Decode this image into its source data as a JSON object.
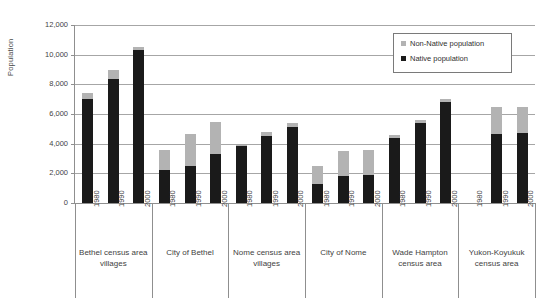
{
  "chart_data": {
    "type": "bar",
    "stacked": true,
    "title": "",
    "xlabel": "",
    "ylabel": "Population",
    "ylim": [
      0,
      12000
    ],
    "ytick_labels": [
      "12,000",
      "10,000",
      "8,000",
      "6,000",
      "4,000",
      "2,000",
      "0"
    ],
    "ytick_values": [
      12000,
      10000,
      8000,
      6000,
      4000,
      2000,
      0
    ],
    "grid": true,
    "legend_position": "top-right",
    "legend": [
      "Non-Native population",
      "Native population"
    ],
    "colors": {
      "native": "#1a1a1a",
      "non_native": "#b3b3b3",
      "gridline": "#a6a6a6",
      "axis": "#8f8f8f",
      "text": "#3f3f3f",
      "background": "#ffffff"
    },
    "categories": [
      "1980",
      "1990",
      "2000"
    ],
    "groups": [
      {
        "label_line1": "Bethel census area",
        "label_line2": "villages",
        "bars": [
          {
            "year": "1980",
            "native": 7000,
            "non_native": 400,
            "total": 7400
          },
          {
            "year": "1990",
            "native": 8350,
            "non_native": 600,
            "total": 8950
          },
          {
            "year": "2000",
            "native": 10300,
            "non_native": 200,
            "total": 10500
          }
        ]
      },
      {
        "label_line1": "City of Bethel",
        "label_line2": "",
        "bars": [
          {
            "year": "1980",
            "native": 2200,
            "non_native": 1400,
            "total": 3600
          },
          {
            "year": "1990",
            "native": 2500,
            "non_native": 2150,
            "total": 4650
          },
          {
            "year": "2000",
            "native": 3300,
            "non_native": 2150,
            "total": 5450
          }
        ]
      },
      {
        "label_line1": "Nome census area",
        "label_line2": "villages",
        "bars": [
          {
            "year": "1980",
            "native": 3850,
            "non_native": 50,
            "total": 3900
          },
          {
            "year": "1990",
            "native": 4500,
            "non_native": 300,
            "total": 4800
          },
          {
            "year": "2000",
            "native": 5150,
            "non_native": 250,
            "total": 5400
          }
        ]
      },
      {
        "label_line1": "City of Nome",
        "label_line2": "",
        "bars": [
          {
            "year": "1980",
            "native": 1300,
            "non_native": 1200,
            "total": 2500
          },
          {
            "year": "1990",
            "native": 1800,
            "non_native": 1700,
            "total": 3500
          },
          {
            "year": "2000",
            "native": 1900,
            "non_native": 1650,
            "total": 3550
          }
        ]
      },
      {
        "label_line1": "Wade Hampton",
        "label_line2": "census area",
        "bars": [
          {
            "year": "1980",
            "native": 4350,
            "non_native": 250,
            "total": 4600
          },
          {
            "year": "1990",
            "native": 5400,
            "non_native": 200,
            "total": 5600
          },
          {
            "year": "2000",
            "native": 6800,
            "non_native": 200,
            "total": 7000
          }
        ]
      },
      {
        "label_line1": "Yukon-Koyukuk",
        "label_line2": "census area",
        "bars": [
          {
            "year": "1980",
            "native": 0,
            "non_native": 0,
            "total": 0
          },
          {
            "year": "1990",
            "native": 4650,
            "non_native": 1850,
            "total": 6500
          },
          {
            "year": "2000",
            "native": 4700,
            "non_native": 1800,
            "total": 6500
          }
        ]
      }
    ]
  }
}
